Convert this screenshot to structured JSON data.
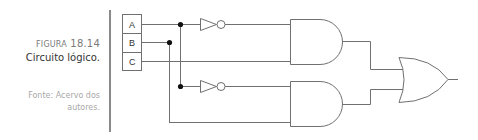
{
  "caption": {
    "figure_prefix": "Figura",
    "figure_number": "18.14",
    "title": "Circuito lógico.",
    "source": "Fonte: Acervo dos autores."
  },
  "diagram": {
    "inputs": [
      "A",
      "B",
      "C"
    ],
    "gates": [
      {
        "id": "not1",
        "type": "NOT",
        "input": "A"
      },
      {
        "id": "not2",
        "type": "NOT",
        "input": "A"
      },
      {
        "id": "and1",
        "type": "AND",
        "inputs": [
          "not1",
          "C"
        ]
      },
      {
        "id": "and2",
        "type": "AND",
        "inputs": [
          "not2",
          "B"
        ]
      },
      {
        "id": "or1",
        "type": "OR",
        "inputs": [
          "and1",
          "and2"
        ]
      }
    ],
    "colors": {
      "stroke": "#707070",
      "junction": "#111111"
    }
  }
}
